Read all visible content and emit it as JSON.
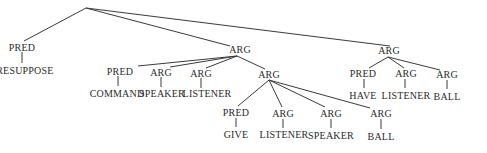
{
  "diagram": {
    "type": "tree",
    "nodes": {
      "root": {
        "label": ""
      },
      "n_pred1": {
        "label": "PRED"
      },
      "n_presuppose": {
        "label": "PRESUPPOSE"
      },
      "n_arg1": {
        "label": "ARG"
      },
      "n_arg2": {
        "label": "ARG"
      },
      "n_pred_cmd": {
        "label": "PRED"
      },
      "n_command": {
        "label": "COMMAND"
      },
      "n_arg_spk": {
        "label": "ARG"
      },
      "n_speaker1": {
        "label": "SPEAKER"
      },
      "n_arg_lst": {
        "label": "ARG"
      },
      "n_listener1": {
        "label": "LISTENER"
      },
      "n_arg_sub": {
        "label": "ARG"
      },
      "n_pred_give": {
        "label": "PRED"
      },
      "n_give": {
        "label": "GIVE"
      },
      "n_arg_lst2": {
        "label": "ARG"
      },
      "n_listener2": {
        "label": "LISTENER"
      },
      "n_arg_spk2": {
        "label": "ARG"
      },
      "n_speaker2": {
        "label": "SPEAKER"
      },
      "n_arg_ball": {
        "label": "ARG"
      },
      "n_ball1": {
        "label": "BALL"
      },
      "n_pred_have": {
        "label": "PRED"
      },
      "n_have": {
        "label": "HAVE"
      },
      "n_arg_lst3": {
        "label": "ARG"
      },
      "n_listener3": {
        "label": "LISTENER"
      },
      "n_arg_ball2": {
        "label": "ARG"
      },
      "n_ball2": {
        "label": "BALL"
      }
    }
  }
}
